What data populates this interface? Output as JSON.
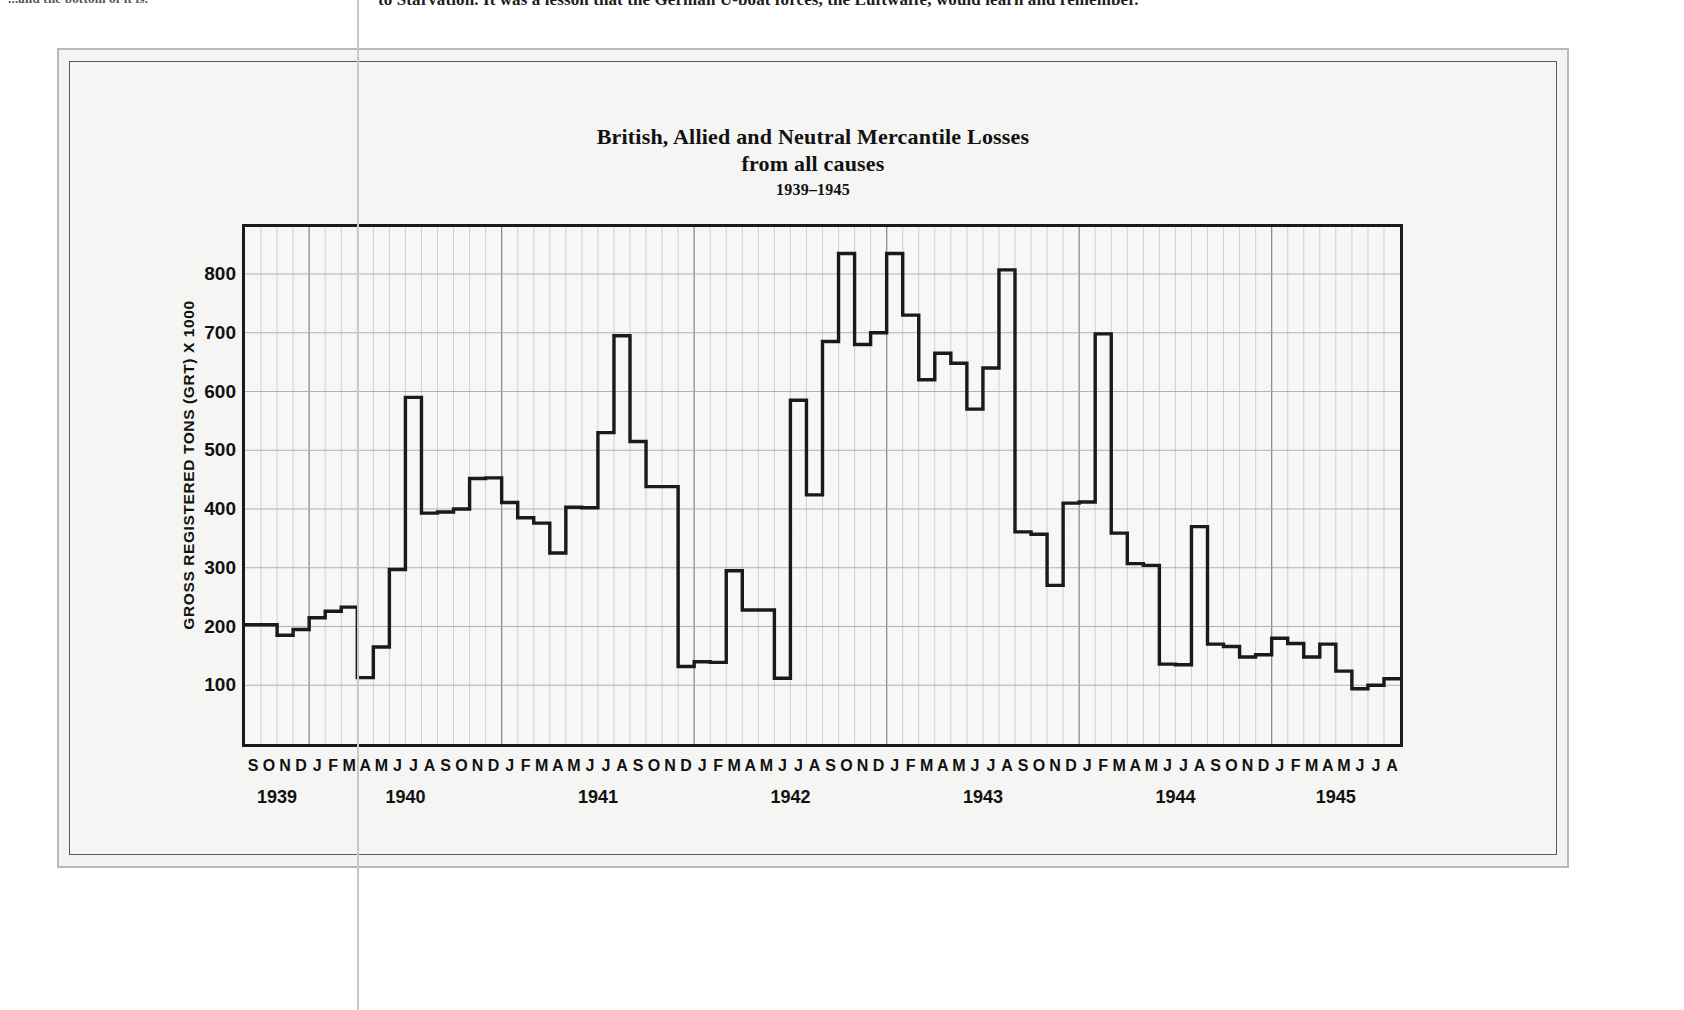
{
  "page": {
    "bleed_text_left": "...and the bottom of it is.",
    "bleed_text_right": "to Starvation. It was a lesson that the German U-boat forces, the Luftwaffe, would learn and remember."
  },
  "chart_data": {
    "type": "line",
    "title": "British, Allied and Neutral Mercantile Losses",
    "subtitle": "from all causes",
    "period": "1939–1945",
    "ylabel": "GROSS REGISTERED TONS (GRT) X 1000",
    "xlabel": "",
    "ylim": [
      0,
      880
    ],
    "y_ticks": [
      100,
      200,
      300,
      400,
      500,
      600,
      700,
      800
    ],
    "grid": true,
    "legend": "none",
    "line_color": "#1a1a1a",
    "step_style": "step-post",
    "x_start": "S 1939",
    "x_end": "A 1945",
    "month_letters": [
      "S",
      "O",
      "N",
      "D",
      "J",
      "F",
      "M",
      "A",
      "M",
      "J",
      "J",
      "A",
      "S",
      "O",
      "N",
      "D",
      "J",
      "F",
      "M",
      "A",
      "M",
      "J",
      "J",
      "A",
      "S",
      "O",
      "N",
      "D",
      "J",
      "F",
      "M",
      "A",
      "M",
      "J",
      "J",
      "A",
      "S",
      "O",
      "N",
      "D",
      "J",
      "F",
      "M",
      "A",
      "M",
      "J",
      "J",
      "A",
      "S",
      "O",
      "N",
      "D",
      "J",
      "F",
      "M",
      "A",
      "M",
      "J",
      "J",
      "A",
      "S",
      "O",
      "N",
      "D",
      "J",
      "F",
      "M",
      "A",
      "M",
      "J",
      "J",
      "A"
    ],
    "year_groups": [
      {
        "label": "1939",
        "start_index": 0,
        "count": 4
      },
      {
        "label": "1940",
        "start_index": 4,
        "count": 12
      },
      {
        "label": "1941",
        "start_index": 16,
        "count": 12
      },
      {
        "label": "1942",
        "start_index": 28,
        "count": 12
      },
      {
        "label": "1943",
        "start_index": 40,
        "count": 12
      },
      {
        "label": "1944",
        "start_index": 52,
        "count": 12
      },
      {
        "label": "1945",
        "start_index": 64,
        "count": 8
      }
    ],
    "categories": [
      "Sep 1939",
      "Oct 1939",
      "Nov 1939",
      "Dec 1939",
      "Jan 1940",
      "Feb 1940",
      "Mar 1940",
      "Apr 1940",
      "May 1940",
      "Jun 1940",
      "Jul 1940",
      "Aug 1940",
      "Sep 1940",
      "Oct 1940",
      "Nov 1940",
      "Dec 1940",
      "Jan 1941",
      "Feb 1941",
      "Mar 1941",
      "Apr 1941",
      "May 1941",
      "Jun 1941",
      "Jul 1941",
      "Aug 1941",
      "Sep 1941",
      "Oct 1941",
      "Nov 1941",
      "Dec 1941",
      "Jan 1942",
      "Feb 1942",
      "Mar 1942",
      "Apr 1942",
      "May 1942",
      "Jun 1942",
      "Jul 1942",
      "Aug 1942",
      "Sep 1942",
      "Oct 1942",
      "Nov 1942",
      "Dec 1942",
      "Jan 1943",
      "Feb 1943",
      "Mar 1943",
      "Apr 1943",
      "May 1943",
      "Jun 1943",
      "Jul 1943",
      "Aug 1943",
      "Sep 1943",
      "Oct 1943",
      "Nov 1943",
      "Dec 1943",
      "Jan 1944",
      "Feb 1944",
      "Mar 1944",
      "Apr 1944",
      "May 1944",
      "Jun 1944",
      "Jul 1944",
      "Aug 1944",
      "Sep 1944",
      "Oct 1944",
      "Nov 1944",
      "Dec 1944",
      "Jan 1945",
      "Feb 1945",
      "Mar 1945",
      "Apr 1945",
      "May 1945",
      "Jun 1945",
      "Jul 1945",
      "Aug 1945"
    ],
    "values": [
      203,
      203,
      185,
      195,
      215,
      226,
      233,
      113,
      165,
      297,
      590,
      393,
      395,
      400,
      452,
      453,
      411,
      385,
      376,
      325,
      403,
      402,
      530,
      695,
      515,
      438,
      438,
      132,
      140,
      139,
      295,
      228,
      228,
      112,
      585,
      424,
      685,
      835,
      680,
      700,
      835,
      730,
      620,
      665,
      648,
      570,
      640,
      807,
      361,
      357,
      270,
      410,
      412,
      698,
      359,
      307,
      304,
      136,
      135,
      370,
      170,
      166,
      148,
      152,
      180,
      171,
      148,
      170,
      124,
      94,
      100,
      111
    ]
  }
}
